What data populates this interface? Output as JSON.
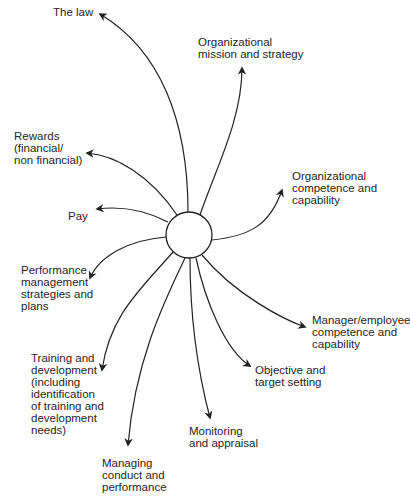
{
  "diagram": {
    "center": {
      "cx": 189,
      "cy": 235,
      "r": 23
    },
    "nodes": [
      {
        "id": "law",
        "label": "The law",
        "x": 53,
        "y": 6,
        "path": "M188 212 C188 120 160 50 100 14",
        "arrow": [
          100,
          14
        ]
      },
      {
        "id": "mission",
        "label": "Organizational\nmission and strategy",
        "x": 198,
        "y": 36,
        "path": "M200 215 C215 170 242 120 242 68",
        "arrow": [
          242,
          68
        ]
      },
      {
        "id": "rewards",
        "label": "Rewards\n(financial/\nnon financial)",
        "x": 14,
        "y": 130,
        "path": "M177 215 C150 175 115 155 87 153",
        "arrow": [
          87,
          153
        ]
      },
      {
        "id": "pay",
        "label": "Pay",
        "x": 68,
        "y": 210,
        "path": "M168 222 C145 210 120 206 97 209",
        "arrow": [
          97,
          209
        ]
      },
      {
        "id": "perf-mgmt",
        "label": "Performance\nmanagement\nstrategies and\nplans",
        "x": 21,
        "y": 264,
        "path": "M166 237 C130 240 100 255 90 278",
        "arrow": [
          90,
          278
        ]
      },
      {
        "id": "org-competence",
        "label": "Organizational\ncompetence and\ncapability",
        "x": 292,
        "y": 170,
        "path": "M212 240 C250 236 270 225 282 190",
        "arrow": [
          282,
          190
        ]
      },
      {
        "id": "mgr-competence",
        "label": "Manager/employee\ncompetence and\ncapability",
        "x": 312,
        "y": 314,
        "path": "M202 255 C235 295 285 320 305 327",
        "arrow": [
          305,
          327
        ]
      },
      {
        "id": "objective",
        "label": "Objective and\ntarget setting",
        "x": 255,
        "y": 364,
        "path": "M196 258 C205 300 225 350 250 366",
        "arrow": [
          250,
          366
        ]
      },
      {
        "id": "monitoring",
        "label": "Monitoring\nand appraisal",
        "x": 189,
        "y": 425,
        "path": "M190 258 C190 330 200 380 210 418",
        "arrow": [
          210,
          418
        ]
      },
      {
        "id": "training",
        "label": "Training and\ndevelopment\n(including\nidentification\nof training and\ndevelopment\nneeds)",
        "x": 31,
        "y": 352,
        "path": "M173 252 C140 290 110 315 102 370",
        "arrow": [
          102,
          370
        ]
      },
      {
        "id": "conduct",
        "label": "Managing\nconduct and\nperformance",
        "x": 102,
        "y": 457,
        "path": "M185 258 C165 300 135 360 128 445",
        "arrow": [
          128,
          445
        ]
      }
    ]
  }
}
